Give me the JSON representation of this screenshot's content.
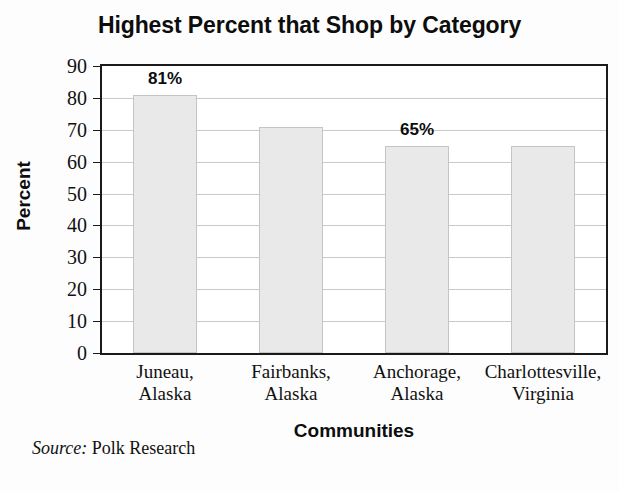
{
  "chart_data": {
    "type": "bar",
    "title": "Highest Percent that Shop by Category",
    "xlabel": "Communities",
    "ylabel": "Percent",
    "categories": [
      "Juneau,\nAlaska",
      "Fairbanks,\nAlaska",
      "Anchorage,\nAlaska",
      "Charlottesville,\nVirginia"
    ],
    "category_lines": [
      [
        "Juneau,",
        "Alaska"
      ],
      [
        "Fairbanks,",
        "Alaska"
      ],
      [
        "Anchorage,",
        "Alaska"
      ],
      [
        "Charlottesville,",
        "Virginia"
      ]
    ],
    "values": [
      81,
      71,
      65,
      65
    ],
    "value_labels": [
      "81%",
      "",
      "65%",
      ""
    ],
    "ylim": [
      0,
      90
    ],
    "ytick_labels": [
      "90",
      "80",
      "70",
      "60",
      "50",
      "40",
      "30",
      "20",
      "10",
      "0"
    ],
    "ytick_values": [
      90,
      80,
      70,
      60,
      50,
      40,
      30,
      20,
      10,
      0
    ],
    "grid": true,
    "legend": "none",
    "bar_color": "#e9e9e9",
    "bar_border_color": "#c4c4c4",
    "axis_color": "#1a1a1a",
    "grid_color": "#c9c9c9",
    "text_color": "#0d0d0d"
  },
  "source": {
    "label": "Source:",
    "text": " Polk Research"
  }
}
